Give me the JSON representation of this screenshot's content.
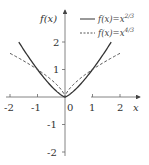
{
  "chart_data": {
    "type": "line",
    "title": "",
    "xlabel": "x",
    "ylabel": "f(x)",
    "xlim": [
      -2.2,
      2.75
    ],
    "ylim": [
      -2.1,
      3.3
    ],
    "x_ticks": [
      "-2",
      "-1",
      "0",
      "1",
      "2"
    ],
    "y_ticks": [
      "2",
      "1",
      "-1",
      "-2"
    ],
    "legend_position": "upper right",
    "series": [
      {
        "name": "f(x)=x^{2/3}",
        "legend_main": "f(x)=x",
        "legend_exp": "2/3",
        "style": "solid",
        "x_range": [
          -1.68,
          1.68
        ],
        "exponent_drawn": 1.333
      },
      {
        "name": "f(x)=x^{4/3}",
        "legend_main": "f(x)=x",
        "legend_exp": "4/3",
        "style": "dashed",
        "x_range": [
          -2.0,
          2.0
        ],
        "exponent_drawn": 0.667
      }
    ],
    "grid": false
  },
  "labels": {
    "y_axis": "f(x)",
    "x_axis": "x",
    "origin": "0"
  },
  "colors": {
    "axis": "#555555",
    "curve": "#333333",
    "text": "#333333"
  }
}
